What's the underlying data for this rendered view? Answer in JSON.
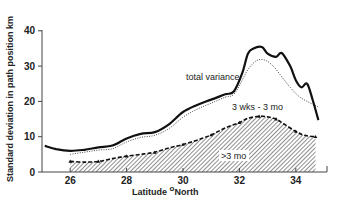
{
  "chart_data": {
    "type": "line",
    "title": "",
    "xlabel": "Latitude °North",
    "ylabel": "Standard deviation in path position km",
    "xlim": [
      25,
      35
    ],
    "ylim": [
      0,
      40
    ],
    "xticks": [
      26,
      28,
      30,
      32,
      34
    ],
    "yticks": [
      0,
      10,
      20,
      30,
      40
    ],
    "grid": false,
    "legend": "inline annotations",
    "annotations": [
      {
        "text": "total variance",
        "x": 30.2,
        "y": 24.5
      },
      {
        "text": "3 wks - 3 mo",
        "x": 32.2,
        "y": 18.5
      },
      {
        "text": ">3 mo",
        "x": 31.8,
        "y": 5.5
      }
    ],
    "series": [
      {
        "name": "total variance",
        "style": "solid-thick",
        "x": [
          25.1,
          25.5,
          26.0,
          26.5,
          27.0,
          27.5,
          28.0,
          28.5,
          29.0,
          29.5,
          30.0,
          30.5,
          31.0,
          31.5,
          31.8,
          32.1,
          32.3,
          32.5,
          32.8,
          33.0,
          33.3,
          33.5,
          33.8,
          34.0,
          34.2,
          34.4,
          34.6,
          34.8
        ],
        "values": [
          7.4,
          6.5,
          6.0,
          6.3,
          7.0,
          7.5,
          9.5,
          10.8,
          11.3,
          13.5,
          17.0,
          19.0,
          20.5,
          22.0,
          22.8,
          28.0,
          33.5,
          35.0,
          35.4,
          33.5,
          32.6,
          33.7,
          30.0,
          26.0,
          24.0,
          25.0,
          20.4,
          14.7
        ]
      },
      {
        "name": "total variance (dotted)",
        "style": "dotted",
        "x": [
          26.0,
          26.5,
          27.0,
          27.5,
          28.0,
          28.5,
          29.0,
          29.5,
          30.0,
          30.5,
          31.0,
          31.5,
          31.8,
          32.1,
          32.3,
          32.6,
          32.9,
          33.2,
          33.5,
          33.8,
          34.1,
          34.4,
          34.8
        ],
        "values": [
          5.0,
          5.6,
          6.2,
          6.6,
          8.5,
          9.8,
          10.4,
          12.3,
          15.5,
          17.8,
          19.5,
          21.2,
          22.0,
          26.0,
          29.0,
          31.5,
          31.7,
          30.0,
          27.0,
          24.0,
          21.5,
          20.0,
          18.4
        ]
      },
      {
        "name": "3 wks - 3 mo",
        "style": "dashed-triangles",
        "x": [
          26.0,
          26.5,
          27.0,
          27.5,
          28.0,
          28.5,
          29.0,
          29.5,
          30.0,
          30.5,
          31.0,
          31.5,
          32.0,
          32.3,
          32.7,
          33.0,
          33.3,
          33.6,
          34.0,
          34.3,
          34.7
        ],
        "values": [
          3.0,
          2.8,
          3.0,
          3.8,
          4.5,
          5.0,
          5.6,
          6.8,
          7.8,
          9.0,
          10.5,
          12.5,
          14.0,
          15.2,
          15.8,
          15.6,
          15.0,
          13.5,
          11.5,
          10.4,
          10.0
        ]
      },
      {
        "name": ">3 mo",
        "style": "hatched-area",
        "description": "area beneath 3 wks - 3 mo curve, hatched",
        "x": [
          26.0,
          34.8
        ],
        "values": [
          0,
          0
        ]
      }
    ]
  }
}
